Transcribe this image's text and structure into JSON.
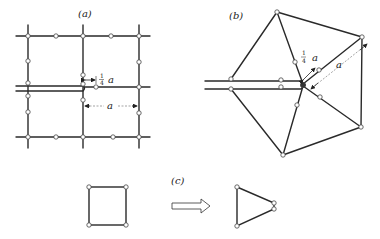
{
  "figure": {
    "panels": [
      {
        "id": "a",
        "label": "(a)",
        "description": "Square mesh with crack; midside nodes near crack tip moved to quarter points"
      },
      {
        "id": "b",
        "label": "(b)",
        "description": "Triangular rosette of elements around crack tip with quarter-point nodes"
      },
      {
        "id": "c",
        "label": "(c)",
        "description": "Quadrilateral element collapsed into triangle"
      }
    ],
    "annotations": {
      "quarter_fraction_num": "1",
      "quarter_fraction_den": "4",
      "quarter_symbol": "a",
      "element_length": "a"
    }
  }
}
